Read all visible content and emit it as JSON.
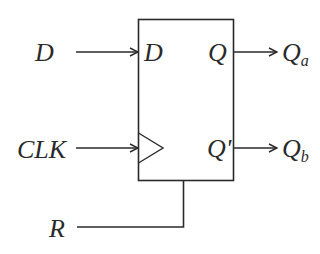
{
  "diagram": {
    "inputs": {
      "d_label": "D",
      "clk_label": "CLK",
      "r_label": "R"
    },
    "block": {
      "d_pin": "D",
      "q_pin": "Q",
      "qbar_pin": "Q'",
      "clock_symbol": "triangle"
    },
    "outputs": {
      "qa_main": "Q",
      "qa_sub": "a",
      "qb_main": "Q",
      "qb_sub": "b"
    },
    "colors": {
      "line": "#2a2a2a",
      "background": "#ffffff"
    }
  }
}
